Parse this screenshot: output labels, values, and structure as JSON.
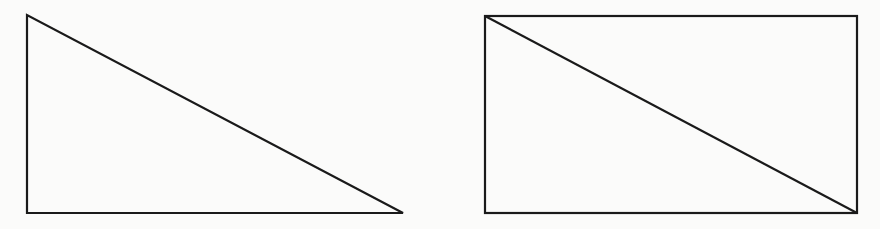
{
  "diagram": {
    "background": "#fbfbfa",
    "stroke_color": "#1a1a1a",
    "stroke_width": 2.2,
    "shapes": [
      {
        "type": "right-triangle",
        "points": [
          [
            27,
            15
          ],
          [
            27,
            213
          ],
          [
            403,
            213
          ]
        ]
      },
      {
        "type": "rectangle-with-diagonal",
        "x": 485,
        "y": 16,
        "width": 372,
        "height": 197,
        "diagonal": [
          [
            485,
            16
          ],
          [
            857,
            213
          ]
        ]
      }
    ]
  }
}
